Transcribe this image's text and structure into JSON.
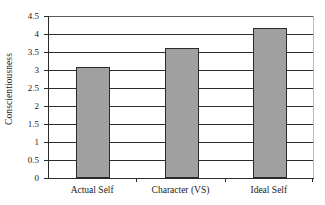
{
  "chart_data": {
    "type": "bar",
    "title": "",
    "xlabel": "",
    "ylabel": "Conscientiousness",
    "categories": [
      "Actual Self",
      "Character (VS)",
      "Ideal Self"
    ],
    "values": [
      3.07,
      3.6,
      4.17
    ],
    "ylim": [
      0,
      4.5
    ],
    "ytick_labels": [
      "4.5",
      "4",
      "3.5",
      "3",
      "2.5",
      "2",
      "1.5",
      "1",
      "0.5",
      "0"
    ],
    "ytick_values": [
      4.5,
      4,
      3.5,
      3,
      2.5,
      2,
      1.5,
      1,
      0.5,
      0
    ],
    "grid": true,
    "grid_axis": "y",
    "legend": false,
    "legend_position": "none",
    "bar_fill_color": "#a0a0a0",
    "bar_border_color": "#2b2b2b",
    "axis_color": "#2b2b2b",
    "background_color": "#ffffff"
  }
}
